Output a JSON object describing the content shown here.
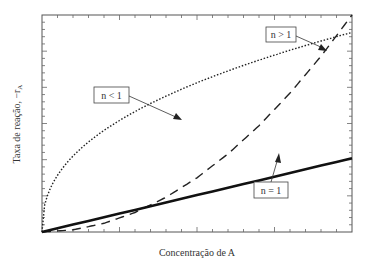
{
  "chart_data": {
    "type": "line",
    "title": "",
    "xlabel": "Concentração de A",
    "ylabel": "Taxa de reação, −r_A",
    "ylabel_text": "Taxa de reação, −r",
    "ylabel_subscript": "A",
    "grid": false,
    "legend_position": "inline annotations",
    "x": [
      0,
      0.1,
      0.2,
      0.3,
      0.4,
      0.5,
      0.6,
      0.7,
      0.8,
      0.9,
      1.0
    ],
    "series": [
      {
        "name": "n < 1",
        "style": "dotted",
        "values": [
          0,
          0.34,
          0.45,
          0.53,
          0.6,
          0.66,
          0.72,
          0.77,
          0.82,
          0.87,
          0.92
        ]
      },
      {
        "name": "n > 1",
        "style": "dashed",
        "values": [
          0,
          0.01,
          0.04,
          0.09,
          0.16,
          0.25,
          0.36,
          0.49,
          0.64,
          0.81,
          1.0
        ]
      },
      {
        "name": "n = 1",
        "style": "solid",
        "values": [
          0,
          0.034,
          0.068,
          0.102,
          0.136,
          0.17,
          0.204,
          0.238,
          0.272,
          0.306,
          0.34
        ]
      }
    ],
    "annotations": [
      {
        "label": "n < 1",
        "points_to": "dotted curve"
      },
      {
        "label": "n > 1",
        "points_to": "dashed curve"
      },
      {
        "label": "n = 1",
        "points_to": "solid line"
      }
    ],
    "xlim": [
      0,
      1
    ],
    "ylim": [
      0,
      1
    ],
    "ticks": "unlabeled minor ticks on all four sides"
  }
}
